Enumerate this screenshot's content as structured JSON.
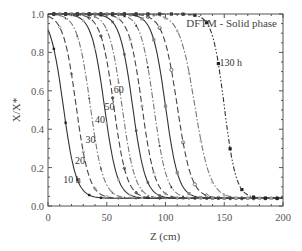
{
  "chart_data": {
    "type": "line",
    "title": "DFTM - Solid phase",
    "xlabel": "Z (cm)",
    "ylabel": "X/X*",
    "xlim": [
      0,
      200
    ],
    "ylim": [
      0.0,
      1.0
    ],
    "xticks": [
      0,
      50,
      100,
      150,
      200
    ],
    "yticks": [
      0.0,
      0.2,
      0.4,
      0.6,
      0.8,
      1.0
    ],
    "xtick_labels": [
      "0",
      "50",
      "100",
      "150",
      "200"
    ],
    "ytick_labels": [
      "0.0",
      "0.2",
      "0.4",
      "0.6",
      "0.8",
      "1.0"
    ],
    "grid": false,
    "annotation": "DFTM - Solid phase",
    "curve_labels": [
      "10 h",
      "20",
      "30",
      "40",
      "50",
      "60",
      "130 h"
    ],
    "x": [
      0,
      10,
      20,
      30,
      40,
      50,
      60,
      70,
      80,
      90,
      100,
      110,
      120,
      130,
      140,
      150,
      160,
      170,
      180,
      190,
      200
    ],
    "series": [
      {
        "name": "10 h",
        "z50": 13,
        "width": 5.5,
        "style": "solid",
        "values": [
          0.81,
          0.61,
          0.22,
          0.07,
          0.04,
          0.04,
          0.04,
          0.04,
          0.04,
          0.04,
          0.04,
          0.04,
          0.04,
          0.04,
          0.04,
          0.04,
          0.04,
          0.04,
          0.04,
          0.04,
          0.04
        ]
      },
      {
        "name": "20 h",
        "z50": 24,
        "width": 5.5,
        "style": "dashed",
        "values": [
          0.97,
          0.92,
          0.75,
          0.27,
          0.08,
          0.04,
          0.04,
          0.04,
          0.04,
          0.04,
          0.04,
          0.04,
          0.04,
          0.04,
          0.04,
          0.04,
          0.04,
          0.04,
          0.04,
          0.04,
          0.04
        ]
      },
      {
        "name": "30 h",
        "z50": 36,
        "width": 5.5,
        "style": "dashdot",
        "values": [
          0.99,
          0.98,
          0.95,
          0.77,
          0.33,
          0.09,
          0.05,
          0.04,
          0.04,
          0.04,
          0.04,
          0.04,
          0.04,
          0.04,
          0.04,
          0.04,
          0.04,
          0.04,
          0.04,
          0.04,
          0.04
        ]
      },
      {
        "name": "40 h",
        "z50": 48,
        "width": 5.5,
        "style": "solid",
        "values": [
          1.0,
          0.99,
          0.99,
          0.96,
          0.82,
          0.41,
          0.11,
          0.05,
          0.04,
          0.04,
          0.04,
          0.04,
          0.04,
          0.04,
          0.04,
          0.04,
          0.04,
          0.04,
          0.04,
          0.04,
          0.04
        ]
      },
      {
        "name": "50 h",
        "z50": 56,
        "width": 5.5,
        "style": "dashed",
        "values": [
          1.0,
          1.0,
          0.99,
          0.99,
          0.94,
          0.74,
          0.33,
          0.09,
          0.05,
          0.04,
          0.04,
          0.04,
          0.04,
          0.04,
          0.04,
          0.04,
          0.04,
          0.04,
          0.04,
          0.04,
          0.04
        ]
      },
      {
        "name": "60 h",
        "z50": 63,
        "width": 5.5,
        "style": "dashdot",
        "values": [
          1.0,
          1.0,
          1.0,
          0.99,
          0.98,
          0.91,
          0.63,
          0.22,
          0.07,
          0.04,
          0.04,
          0.04,
          0.04,
          0.04,
          0.04,
          0.04,
          0.04,
          0.04,
          0.04,
          0.04,
          0.04
        ]
      },
      {
        "name": "70 h",
        "z50": 72,
        "width": 5.5,
        "style": "solid",
        "values": [
          1.0,
          1.0,
          1.0,
          1.0,
          0.99,
          0.98,
          0.9,
          0.59,
          0.19,
          0.06,
          0.04,
          0.04,
          0.04,
          0.04,
          0.04,
          0.04,
          0.04,
          0.04,
          0.04,
          0.04,
          0.04
        ]
      },
      {
        "name": "80 h",
        "z50": 80,
        "width": 5.5,
        "style": "dashed",
        "values": [
          1.0,
          1.0,
          1.0,
          1.0,
          1.0,
          0.99,
          0.97,
          0.86,
          0.5,
          0.15,
          0.06,
          0.04,
          0.04,
          0.04,
          0.04,
          0.04,
          0.04,
          0.04,
          0.04,
          0.04,
          0.04
        ]
      },
      {
        "name": "90 h",
        "z50": 90,
        "width": 5.5,
        "style": "dashdot",
        "values": [
          1.0,
          1.0,
          1.0,
          1.0,
          1.0,
          1.0,
          0.99,
          0.97,
          0.86,
          0.5,
          0.15,
          0.06,
          0.04,
          0.04,
          0.04,
          0.04,
          0.04,
          0.04,
          0.04,
          0.04,
          0.04
        ]
      },
      {
        "name": "100 h",
        "z50": 100,
        "width": 5.5,
        "style": "solid",
        "values": [
          1.0,
          1.0,
          1.0,
          1.0,
          1.0,
          1.0,
          1.0,
          0.99,
          0.97,
          0.86,
          0.5,
          0.15,
          0.06,
          0.04,
          0.04,
          0.04,
          0.04,
          0.04,
          0.04,
          0.04,
          0.04
        ]
      },
      {
        "name": "110 h",
        "z50": 110,
        "width": 6.0,
        "style": "dashed",
        "values": [
          1.0,
          1.0,
          1.0,
          1.0,
          1.0,
          1.0,
          1.0,
          1.0,
          0.99,
          0.96,
          0.84,
          0.5,
          0.17,
          0.06,
          0.04,
          0.04,
          0.04,
          0.04,
          0.04,
          0.04,
          0.04
        ]
      },
      {
        "name": "120 h",
        "z50": 125,
        "width": 6.5,
        "style": "dashdot",
        "values": [
          1.0,
          1.0,
          1.0,
          1.0,
          1.0,
          1.0,
          1.0,
          1.0,
          1.0,
          0.99,
          0.98,
          0.91,
          0.7,
          0.31,
          0.09,
          0.05,
          0.04,
          0.04,
          0.04,
          0.04,
          0.04
        ]
      },
      {
        "name": "130 h",
        "z50": 150,
        "width": 5.0,
        "style": "dashdotdot",
        "values": [
          1.0,
          1.0,
          1.0,
          1.0,
          1.0,
          1.0,
          1.0,
          1.0,
          1.0,
          1.0,
          1.0,
          1.0,
          0.99,
          0.98,
          0.88,
          0.5,
          0.15,
          0.06,
          0.04,
          0.04,
          0.04
        ]
      }
    ]
  },
  "layout": {
    "plot": {
      "left": 48,
      "right": 283,
      "top": 14,
      "bottom": 206
    },
    "label_positions": [
      {
        "text": "10 h",
        "x": 13,
        "y": 0.12
      },
      {
        "text": "20",
        "x": 23,
        "y": 0.22
      },
      {
        "text": "30",
        "x": 32,
        "y": 0.33
      },
      {
        "text": "40",
        "x": 40,
        "y": 0.43
      },
      {
        "text": "50",
        "x": 48,
        "y": 0.5
      },
      {
        "text": "60",
        "x": 56,
        "y": 0.59
      },
      {
        "text": "130 h",
        "x": 146,
        "y": 0.73
      }
    ]
  },
  "colors": {
    "axis": "#555555",
    "curve": "#333333",
    "curve_light": "#777777",
    "marker": "#333333"
  }
}
